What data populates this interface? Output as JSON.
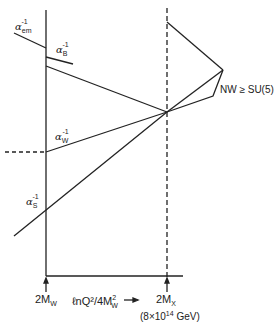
{
  "diagram": {
    "type": "running couplings unification",
    "labels": {
      "alpha_em": {
        "base": "α",
        "sub": "em",
        "sup": "-1"
      },
      "alpha_B": {
        "base": "α",
        "sub": "B",
        "sup": "-1"
      },
      "alpha_W": {
        "base": "α",
        "sub": "W",
        "sup": "-1"
      },
      "alpha_S": {
        "base": "α",
        "sub": "S",
        "sup": "-1"
      },
      "extension": "NW ≥ SU(5)"
    },
    "x_axis": {
      "left_tick": "2M",
      "left_tick_sub": "W",
      "axis_label": "ℓnQ²/4M",
      "axis_label_sup": "2",
      "axis_label_sub": "W",
      "arrow": "→",
      "right_tick": "2M",
      "right_tick_sub": "X",
      "right_tick_value": "(8×10",
      "right_tick_exp": "14",
      "right_tick_unit": " GeV)"
    }
  }
}
